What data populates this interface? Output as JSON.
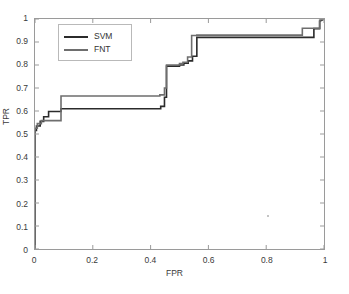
{
  "chart_data": {
    "type": "line",
    "title": "",
    "xlabel": "FPR",
    "ylabel": "TPR",
    "xlim": [
      0,
      1
    ],
    "ylim": [
      0,
      1
    ],
    "grid": false,
    "legend_position": "upper-left",
    "xticks": [
      "0",
      "0.2",
      "0.4",
      "0.6",
      "0.8",
      "1"
    ],
    "xtick_values": [
      0,
      0.2,
      0.4,
      0.6,
      0.8,
      1
    ],
    "yticks": [
      "0",
      "0.1",
      "0.2",
      "0.3",
      "0.4",
      "0.5",
      "0.6",
      "0.7",
      "0.8",
      "0.9",
      "1"
    ],
    "ytick_values": [
      0,
      0.1,
      0.2,
      0.3,
      0.4,
      0.5,
      0.6,
      0.7,
      0.8,
      0.9,
      1
    ],
    "series": [
      {
        "name": "SVM",
        "color": "#2b2b2b",
        "linewidth": 1.6,
        "x": [
          0,
          0,
          0.005,
          0.005,
          0.018,
          0.018,
          0.03,
          0.03,
          0.047,
          0.047,
          0.09,
          0.09,
          0.435,
          0.435,
          0.448,
          0.448,
          0.455,
          0.455,
          0.5,
          0.5,
          0.515,
          0.515,
          0.53,
          0.53,
          0.545,
          0.545,
          0.56,
          0.56,
          0.965,
          0.965,
          0.985,
          0.985,
          1.0
        ],
        "y": [
          0,
          0.515,
          0.515,
          0.535,
          0.535,
          0.555,
          0.555,
          0.575,
          0.575,
          0.598,
          0.598,
          0.61,
          0.61,
          0.62,
          0.62,
          0.66,
          0.66,
          0.795,
          0.795,
          0.8,
          0.8,
          0.808,
          0.808,
          0.818,
          0.818,
          0.838,
          0.838,
          0.92,
          0.92,
          0.958,
          0.958,
          0.99,
          1.0
        ]
      },
      {
        "name": "FNT",
        "color": "#6e6e6e",
        "linewidth": 1.6,
        "x": [
          0,
          0,
          0.008,
          0.008,
          0.022,
          0.022,
          0.09,
          0.09,
          0.432,
          0.432,
          0.448,
          0.448,
          0.455,
          0.455,
          0.5,
          0.5,
          0.512,
          0.512,
          0.528,
          0.528,
          0.542,
          0.542,
          0.56,
          0.56,
          0.925,
          0.925,
          0.985,
          0.985,
          1.0
        ],
        "y": [
          0,
          0.525,
          0.525,
          0.545,
          0.545,
          0.558,
          0.558,
          0.665,
          0.665,
          0.67,
          0.67,
          0.7,
          0.7,
          0.8,
          0.8,
          0.806,
          0.806,
          0.812,
          0.812,
          0.835,
          0.835,
          0.928,
          0.928,
          0.93,
          0.93,
          0.96,
          0.96,
          0.995,
          1.0
        ]
      }
    ],
    "annotations": [
      {
        "name": "stray-marker",
        "x": 0.805,
        "y": 0.145
      }
    ]
  },
  "legend": {
    "entries": [
      {
        "label": "SVM",
        "color": "#2b2b2b"
      },
      {
        "label": "FNT",
        "color": "#6e6e6e"
      }
    ]
  },
  "caption": {
    "text": ""
  }
}
